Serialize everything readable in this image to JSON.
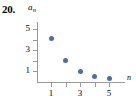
{
  "problem": {
    "number": "20."
  },
  "axes": {
    "y_caption_base": "a",
    "y_caption_sub": "n",
    "x_caption": "n"
  },
  "chart_data": {
    "type": "scatter",
    "title": "",
    "xlabel": "n",
    "ylabel": "a_n",
    "x": [
      1,
      2,
      3,
      4,
      5
    ],
    "values": [
      4.1,
      2.0,
      1.0,
      0.55,
      0.3
    ],
    "series": [
      {
        "name": "a_n",
        "values": [
          4.1,
          2.0,
          1.0,
          0.55,
          0.3
        ]
      }
    ],
    "xlim": [
      0,
      5.9
    ],
    "ylim": [
      0,
      5.6
    ],
    "xticks": [
      1,
      2,
      3,
      4,
      5
    ],
    "xtick_labels": [
      "1",
      "",
      "3",
      "",
      "5"
    ],
    "yticks": [
      1,
      2,
      3,
      4,
      5
    ],
    "ytick_labels": [
      "1",
      "",
      "3",
      "",
      "5"
    ],
    "grid": false,
    "legend": "none",
    "marker_color": "#4472a8",
    "axis_color": "#9a9a9a"
  }
}
